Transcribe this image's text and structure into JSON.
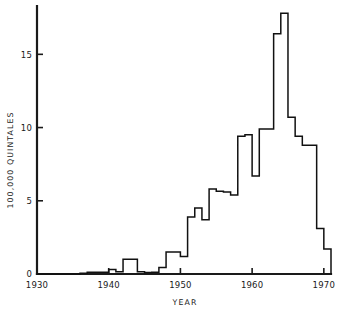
{
  "chart_data": {
    "type": "line",
    "subtype": "step-post",
    "title": "",
    "xlabel": "YEAR",
    "ylabel": "100,000 QUINTALES",
    "xlim": [
      1930,
      1971
    ],
    "ylim": [
      0,
      18.3
    ],
    "grid": false,
    "legend": null,
    "xticks": [
      1930,
      1940,
      1950,
      1960,
      1970
    ],
    "xtick_labels": [
      "1930",
      "1940",
      "1950",
      "1960",
      "1970"
    ],
    "yticks": [
      0,
      5,
      10,
      15
    ],
    "ytick_labels": [
      "0",
      "5",
      "10",
      "15"
    ],
    "line_color": "#111111",
    "axis_color": "#1a1a1a",
    "background_color": "#ffffff",
    "x": [
      1930,
      1931,
      1932,
      1933,
      1934,
      1935,
      1936,
      1937,
      1938,
      1939,
      1940,
      1941,
      1942,
      1943,
      1944,
      1945,
      1946,
      1947,
      1948,
      1949,
      1950,
      1951,
      1952,
      1953,
      1954,
      1955,
      1956,
      1957,
      1958,
      1959,
      1960,
      1961,
      1962,
      1963,
      1964,
      1965,
      1966,
      1967,
      1968,
      1969,
      1970
    ],
    "values": [
      0.0,
      0.0,
      0.0,
      0.0,
      0.0,
      0.0,
      0.05,
      0.12,
      0.12,
      0.12,
      0.3,
      0.15,
      1.0,
      1.0,
      0.15,
      0.1,
      0.12,
      0.45,
      1.5,
      1.5,
      1.2,
      3.9,
      4.5,
      3.7,
      5.8,
      5.65,
      5.6,
      5.4,
      9.4,
      9.5,
      6.7,
      9.9,
      9.9,
      16.4,
      17.8,
      10.7,
      9.4,
      8.8,
      8.8,
      3.1,
      1.7
    ],
    "notes": {
      "peak_year": 1964,
      "peak_value": 17.8,
      "series_name": "quintales"
    }
  },
  "axes": {
    "y_axis_label": "100,000 QUINTALES",
    "x_axis_label": "YEAR"
  }
}
